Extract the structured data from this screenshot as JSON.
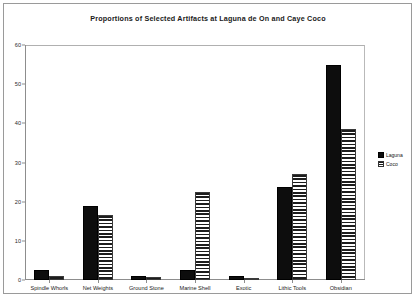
{
  "chart_data": {
    "type": "bar",
    "title": "Proportions of Selected Artifacts at Laguna de On and Caye Coco",
    "xlabel": "",
    "ylabel": "",
    "ylim": [
      0,
      60
    ],
    "yticks": [
      0,
      10,
      20,
      30,
      40,
      50,
      60
    ],
    "grid": false,
    "legend_position": "right",
    "categories": [
      "Spindle Whorls",
      "Net Weights",
      "Ground Stone",
      "Marine Shell",
      "Exotic",
      "Lithic Tools",
      "Obsidian"
    ],
    "series": [
      {
        "name": "Laguna",
        "color": "#0d0d0d",
        "pattern": "solid",
        "values": [
          2.6,
          19.0,
          1.0,
          2.5,
          0.9,
          23.8,
          55.0
        ]
      },
      {
        "name": "Coco",
        "color": "#1d1d1d",
        "pattern": "horizontal-stripes",
        "values": [
          1.0,
          16.7,
          0.8,
          22.5,
          0.3,
          27.0,
          38.5
        ]
      }
    ]
  },
  "legend": {
    "items": [
      {
        "label": "Laguna"
      },
      {
        "label": "Coco"
      }
    ]
  }
}
